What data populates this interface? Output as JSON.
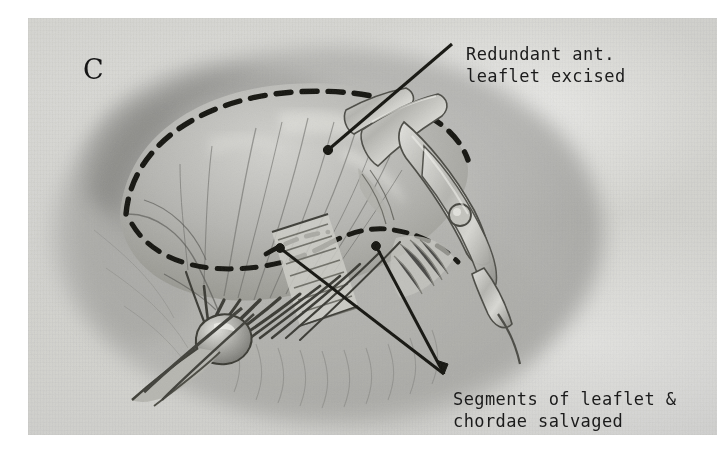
{
  "figure": {
    "panel_letter": "C",
    "medium": "graphite pencil drawing on paper",
    "background_color": "#e9e9e7",
    "ink_color": "#1b1b1b"
  },
  "annotations": [
    {
      "id": "redundant-anterior-leaflet",
      "line1": "Redundant ant.",
      "line2": "leaflet excised",
      "leader": "single diagonal line with terminal dot pointing down-left onto the excised leaflet body"
    },
    {
      "id": "salvaged-segments",
      "line1": "Segments of leaflet &",
      "line2": "chordae salvaged",
      "leader": "two leader lines fanning up-left from a common point to two preserved leaflet segments"
    }
  ],
  "structures": [
    {
      "name": "dashed-excision-outline",
      "description": "bold dashed curve outlining the redundant leaflet to be removed"
    },
    {
      "name": "anterior-leaflet",
      "description": "fan-shaped valve leaflet tissue with radial fiber striations"
    },
    {
      "name": "chordae-tendineae",
      "description": "converging cord-like strands running to the papillary muscle"
    },
    {
      "name": "papillary-muscle",
      "description": "rounded muscle head where the chordae converge, lower left of center"
    },
    {
      "name": "cut-leaflet-edge",
      "description": "ribbed hatched band marking the freshly cut leaflet margin"
    },
    {
      "name": "surgical-clamp",
      "description": "two-jaw hemostat clamp with hinge rivet, entering from upper right"
    },
    {
      "name": "ventricular-wall",
      "description": "soft shaded chamber wall forming the surrounding cavity"
    }
  ]
}
